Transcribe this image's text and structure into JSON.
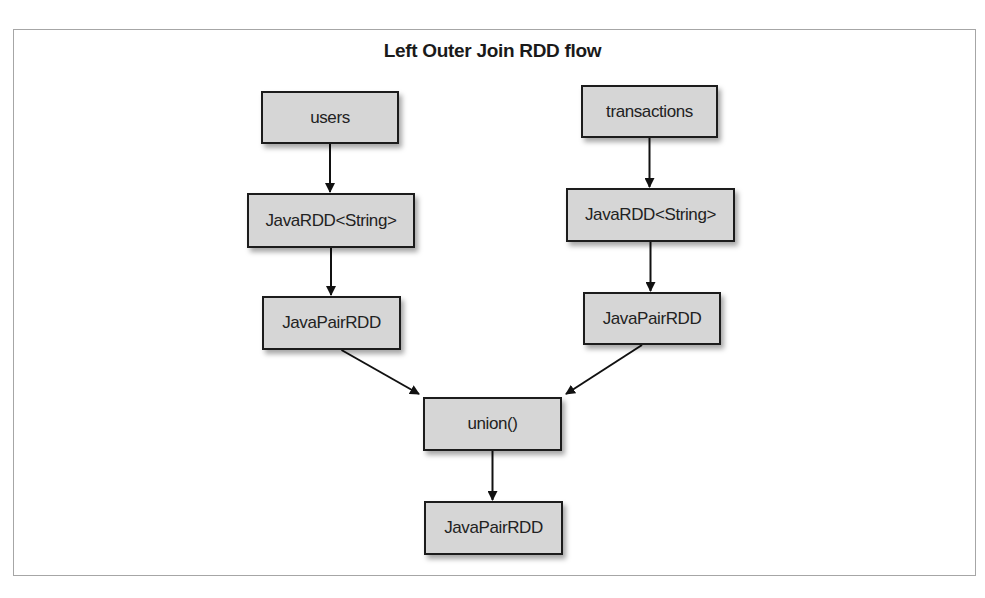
{
  "diagram": {
    "title": "Left Outer Join RDD flow",
    "nodes": {
      "users": "users",
      "transactions": "transactions",
      "users_javardd": "JavaRDD<String>",
      "transactions_javardd": "JavaRDD<String>",
      "users_pairrdd": "JavaPairRDD",
      "transactions_pairrdd": "JavaPairRDD",
      "union": "union()",
      "result_pairrdd": "JavaPairRDD"
    },
    "edges": [
      {
        "from": "users",
        "to": "users_javardd"
      },
      {
        "from": "users_javardd",
        "to": "users_pairrdd"
      },
      {
        "from": "transactions",
        "to": "transactions_javardd"
      },
      {
        "from": "transactions_javardd",
        "to": "transactions_pairrdd"
      },
      {
        "from": "users_pairrdd",
        "to": "union"
      },
      {
        "from": "transactions_pairrdd",
        "to": "union"
      },
      {
        "from": "union",
        "to": "result_pairrdd"
      }
    ]
  }
}
